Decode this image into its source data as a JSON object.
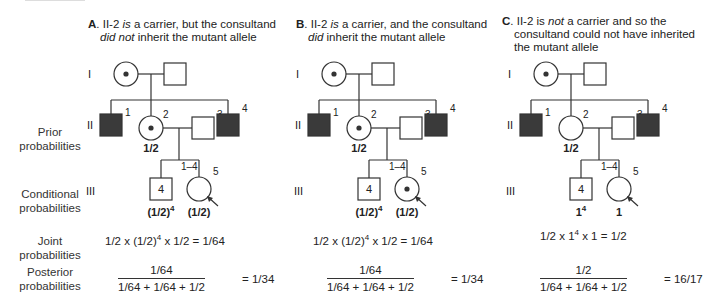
{
  "row_labels": {
    "prior": [
      "Prior",
      "probabilities"
    ],
    "conditional": [
      "Conditional",
      "probabilities"
    ],
    "joint": [
      "Joint",
      "probabilities"
    ],
    "posterior": [
      "Posterior",
      "probabilities"
    ]
  },
  "generation_labels": [
    "I",
    "II",
    "III"
  ],
  "panels": [
    {
      "letter": "A",
      "title_parts": [
        "II-2 ",
        "is",
        " a carrier, but the consultand"
      ],
      "title_line2_parts": [
        "did not",
        " inherit the mutant allele"
      ],
      "title_line3": "",
      "ii2_carrier": true,
      "iii5_carrier": false,
      "prior": "1/2",
      "cond_sibs_base": "(1/2)",
      "cond_sibs_exp": "4",
      "cond_proband": "(1/2)",
      "joint_pre": "1/2 x (1/2)",
      "joint_exp": "4",
      "joint_post": " x 1/2 = 1/64",
      "posterior_num": "1/64",
      "posterior_den": "1/64 + 1/64 + 1/2",
      "posterior_result": "= 1/34"
    },
    {
      "letter": "B",
      "title_parts": [
        "II-2 ",
        "is",
        " a carrier, and the consultand"
      ],
      "title_line2_parts": [
        "did",
        " inherit the mutant allele"
      ],
      "title_line3": "",
      "ii2_carrier": true,
      "iii5_carrier": true,
      "prior": "1/2",
      "cond_sibs_base": "(1/2)",
      "cond_sibs_exp": "4",
      "cond_proband": "(1/2)",
      "joint_pre": "1/2 x (1/2)",
      "joint_exp": "4",
      "joint_post": " x 1/2 = 1/64",
      "posterior_num": "1/64",
      "posterior_den": "1/64 + 1/64 + 1/2",
      "posterior_result": "= 1/34"
    },
    {
      "letter": "C",
      "title_parts": [
        "II-2 is ",
        "not",
        " a carrier and so the"
      ],
      "title_line2_parts": [
        "consultand could not have inherited",
        ""
      ],
      "title_line3": "the mutant allele",
      "ii2_carrier": false,
      "iii5_carrier": false,
      "prior": "1/2",
      "cond_sibs_base": "1",
      "cond_sibs_exp": "4",
      "cond_proband": "1",
      "joint_pre": "1/2 x 1",
      "joint_exp": "4",
      "joint_post": " x 1 = 1/2",
      "posterior_num": "1/2",
      "posterior_den": "1/64 + 1/64 + 1/2",
      "posterior_result": "= 16/17"
    }
  ],
  "individual_numbers": {
    "ii": [
      "1",
      "2",
      "3",
      "4"
    ],
    "iii_sibs_box": "4",
    "iii_sibs_range": "1–4",
    "iii_proband": "5"
  },
  "colors": {
    "affected_fill": "#3a3a3a",
    "line": "#333333",
    "text": "#222222"
  }
}
